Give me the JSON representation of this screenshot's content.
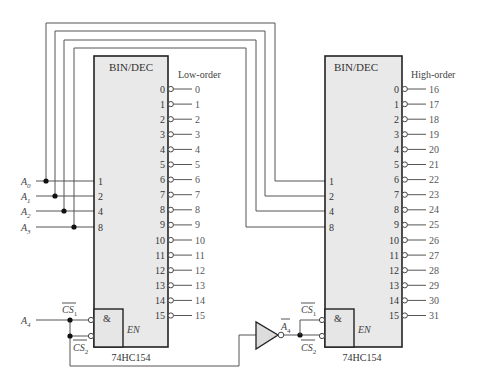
{
  "diagram": {
    "type": "logic-schematic"
  },
  "decoders": [
    {
      "id": "low",
      "title": "BIN/DEC",
      "part_number": "74HC154",
      "group_label": "Low-order",
      "inputs": [
        "1",
        "2",
        "4",
        "8"
      ],
      "output_pins": [
        "0",
        "1",
        "2",
        "3",
        "4",
        "5",
        "6",
        "7",
        "8",
        "9",
        "10",
        "11",
        "12",
        "13",
        "14",
        "15"
      ],
      "output_labels": [
        "0",
        "1",
        "2",
        "3",
        "4",
        "5",
        "6",
        "7",
        "8",
        "9",
        "10",
        "11",
        "12",
        "13",
        "14",
        "15"
      ],
      "enable_gate": "&",
      "enable_label": "EN",
      "cs1": "CS",
      "cs1_sub": "1",
      "cs2": "CS",
      "cs2_sub": "2"
    },
    {
      "id": "high",
      "title": "BIN/DEC",
      "part_number": "74HC154",
      "group_label": "High-order",
      "inputs": [
        "1",
        "2",
        "4",
        "8"
      ],
      "output_pins": [
        "0",
        "1",
        "2",
        "3",
        "4",
        "5",
        "6",
        "7",
        "8",
        "9",
        "10",
        "11",
        "12",
        "13",
        "14",
        "15"
      ],
      "output_labels": [
        "16",
        "17",
        "18",
        "19",
        "20",
        "21",
        "22",
        "23",
        "24",
        "25",
        "26",
        "27",
        "28",
        "29",
        "30",
        "31"
      ],
      "enable_gate": "&",
      "enable_label": "EN",
      "cs1": "CS",
      "cs1_sub": "1",
      "cs2": "CS",
      "cs2_sub": "2"
    }
  ],
  "address_inputs": [
    {
      "name": "A",
      "sub": "0"
    },
    {
      "name": "A",
      "sub": "1"
    },
    {
      "name": "A",
      "sub": "2"
    },
    {
      "name": "A",
      "sub": "3"
    },
    {
      "name": "A",
      "sub": "4"
    }
  ],
  "inverter": {
    "output_label": "A",
    "output_sub": "4",
    "overbar": true
  },
  "colors": {
    "box_fill": "#e9e9e9",
    "stroke": "#222222",
    "wire": "#555555",
    "background": "#ffffff"
  }
}
